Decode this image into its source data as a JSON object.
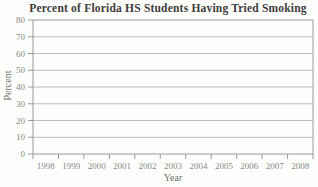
{
  "chart": {
    "title": "Percent of Florida HS Students Having Tried Smoking",
    "xlabel": "Year",
    "ylabel": "Percent"
  },
  "chart_data": {
    "type": "line",
    "title": "Percent of Florida HS Students Having Tried Smoking",
    "xlabel": "Year",
    "ylabel": "Percent",
    "categories": [
      "1998",
      "1999",
      "2000",
      "2001",
      "2002",
      "2003",
      "2004",
      "2005",
      "2006",
      "2007",
      "2008"
    ],
    "series": [],
    "ylim": [
      0,
      80
    ],
    "ytick_step": 10,
    "yticks": [
      0,
      10,
      20,
      30,
      40,
      50,
      60,
      70,
      80
    ],
    "grid": true,
    "legend": "none",
    "colors": {
      "background": "#fdfdfb",
      "title": "#3d3d3d",
      "axis_label": "#6f6f6f",
      "tick_text": "#8a8a8a",
      "gridline": "#bcbcbc",
      "frame": "#9a9a9a"
    }
  }
}
